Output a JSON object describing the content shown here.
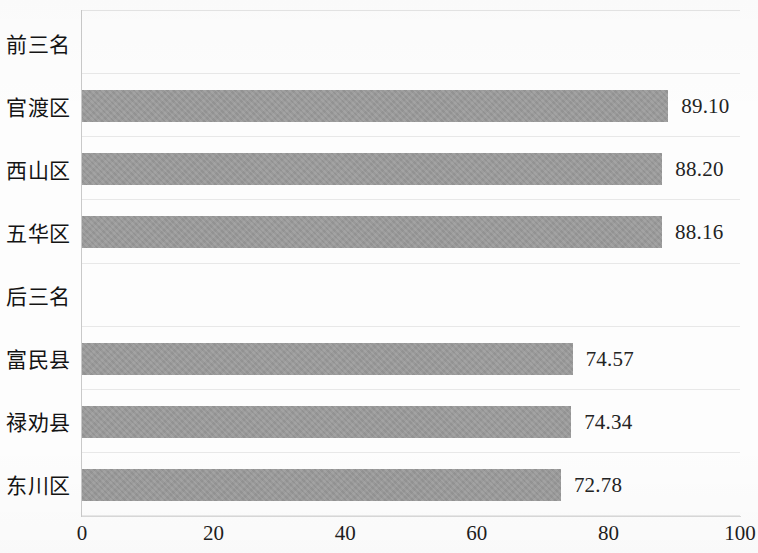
{
  "chart_data": {
    "type": "bar",
    "orientation": "horizontal",
    "title": "",
    "xlabel": "",
    "ylabel": "",
    "xlim": [
      0,
      100
    ],
    "xticks": [
      "0",
      "20",
      "40",
      "60",
      "80",
      "100"
    ],
    "grid": true,
    "legend": null,
    "bar_color": "#9a9a9a",
    "categories": [
      "前三名",
      "官渡区",
      "西山区",
      "五华区",
      "后三名",
      "富民县",
      "禄劝县",
      "东川区"
    ],
    "values": [
      null,
      89.1,
      88.2,
      88.16,
      null,
      74.57,
      74.34,
      72.78
    ],
    "value_labels": [
      "",
      "89.10",
      "88.20",
      "88.16",
      "",
      "74.57",
      "74.34",
      "72.78"
    ],
    "group_headers": [
      "前三名",
      "后三名"
    ],
    "rows": [
      {
        "category": "前三名",
        "value": null,
        "label": "",
        "is_header": true
      },
      {
        "category": "官渡区",
        "value": 89.1,
        "label": "89.10",
        "is_header": false
      },
      {
        "category": "西山区",
        "value": 88.2,
        "label": "88.20",
        "is_header": false
      },
      {
        "category": "五华区",
        "value": 88.16,
        "label": "88.16",
        "is_header": false
      },
      {
        "category": "后三名",
        "value": null,
        "label": "",
        "is_header": true
      },
      {
        "category": "富民县",
        "value": 74.57,
        "label": "74.57",
        "is_header": false
      },
      {
        "category": "禄劝县",
        "value": 74.34,
        "label": "74.34",
        "is_header": false
      },
      {
        "category": "东川区",
        "value": 72.78,
        "label": "72.78",
        "is_header": false
      }
    ]
  }
}
